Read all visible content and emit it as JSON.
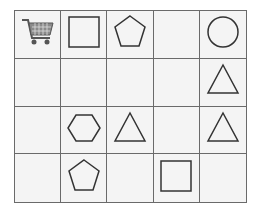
{
  "grid": {
    "rows": 4,
    "cols": 5,
    "cells": [
      [
        "cart",
        "square",
        "pentagon",
        "",
        "circle"
      ],
      [
        "",
        "",
        "",
        "",
        "triangle"
      ],
      [
        "",
        "hexagon",
        "triangle",
        "",
        "triangle"
      ],
      [
        "",
        "pentagon",
        "",
        "square",
        ""
      ]
    ]
  },
  "colors": {
    "stroke": "#333333",
    "grid_line": "#6a6a6a",
    "cell_bg": "#f4f4f4"
  }
}
